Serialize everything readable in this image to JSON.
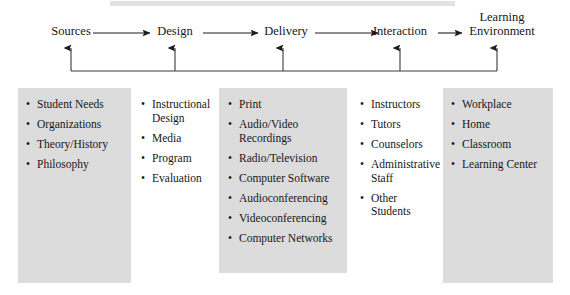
{
  "diagram": {
    "flow": {
      "stages": [
        {
          "id": "sources",
          "label": "Sources"
        },
        {
          "id": "design",
          "label": "Design"
        },
        {
          "id": "delivery",
          "label": "Delivery"
        },
        {
          "id": "interaction",
          "label": "Interaction"
        },
        {
          "id": "learning-environment",
          "label": "Learning\nEnvironment"
        }
      ],
      "forward_arrow_count": 4,
      "feedback_arrow_count": 5,
      "feedback_description": "Feedback loop returning from Learning Environment to every prior stage"
    },
    "columns": [
      {
        "id": "sources",
        "shaded": true,
        "items": [
          "Student Needs",
          "Organizations",
          "Theory/History",
          "Philosophy"
        ]
      },
      {
        "id": "design",
        "shaded": false,
        "items": [
          "Instructional Design",
          "Media",
          "Program",
          "Evaluation"
        ]
      },
      {
        "id": "delivery",
        "shaded": true,
        "items": [
          "Print",
          "Audio/Video Recordings",
          "Radio/Television",
          "Computer Software",
          "Audioconferencing",
          "Videoconferencing",
          "Computer Networks"
        ]
      },
      {
        "id": "interaction",
        "shaded": false,
        "items": [
          "Instructors",
          "Tutors",
          "Counselors",
          "Administrative Staff",
          "Other Students"
        ]
      },
      {
        "id": "learning-environment",
        "shaded": true,
        "items": [
          "Workplace",
          "Home",
          "Classroom",
          "Learning Center"
        ]
      }
    ],
    "bullet_glyph": "•",
    "colors": {
      "shade": "#dcdcdc",
      "ink": "#171717",
      "background": "#ffffff"
    }
  }
}
